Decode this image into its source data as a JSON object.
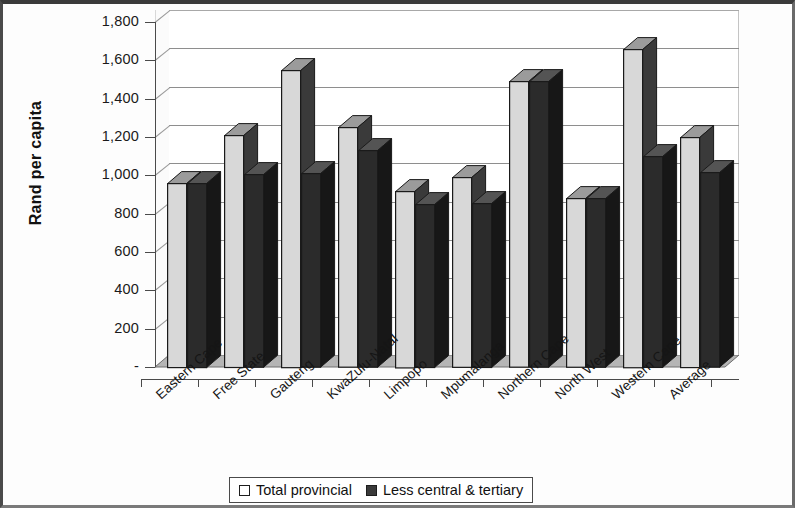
{
  "chart_data": {
    "type": "bar",
    "title": "",
    "xlabel": "",
    "ylabel": "Rand per capita",
    "ylim": [
      0,
      1800
    ],
    "ytick_step": 200,
    "grid": true,
    "legend_position": "bottom",
    "style": "3d-clustered-column",
    "categories": [
      "Eastern Cape",
      "Free State",
      "Gauteng",
      "KwaZulu-Natal",
      "Limpopo",
      "Mpumalanga",
      "Northern Cape",
      "North West",
      "Western Cape",
      "Average"
    ],
    "series": [
      {
        "name": "Total provincial",
        "color": "#d6d6d6",
        "values": [
          960,
          1210,
          1550,
          1250,
          920,
          990,
          1490,
          880,
          1660,
          1200
        ]
      },
      {
        "name": "Less central & tertiary",
        "color": "#2e2e2e",
        "values": [
          960,
          1005,
          1010,
          1130,
          850,
          855,
          1490,
          880,
          1100,
          1015
        ]
      }
    ],
    "ytick_labels": [
      "-",
      "200",
      "400",
      "600",
      "800",
      "1,000",
      "1,200",
      "1,400",
      "1,600",
      "1,800"
    ],
    "ytick_values": [
      0,
      200,
      400,
      600,
      800,
      1000,
      1200,
      1400,
      1600,
      1800
    ]
  },
  "legend": {
    "items": [
      {
        "label": "Total provincial",
        "swatch": "light"
      },
      {
        "label": "Less central & tertiary",
        "swatch": "dark"
      }
    ]
  }
}
